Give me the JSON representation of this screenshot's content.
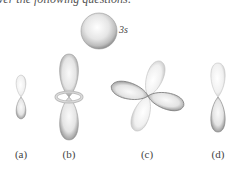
{
  "intro_text": "ver the following questions:",
  "orbitals": {
    "s": {
      "label": "3s"
    },
    "a": {
      "label": "(a)"
    },
    "b": {
      "label": "(b)"
    },
    "c": {
      "label": "(c)"
    },
    "d": {
      "label": "(d)"
    }
  },
  "colors": {
    "lobe_light": "#f2f2f2",
    "lobe_dark": "#8a8a8a",
    "outline": "#9a9a9a"
  }
}
